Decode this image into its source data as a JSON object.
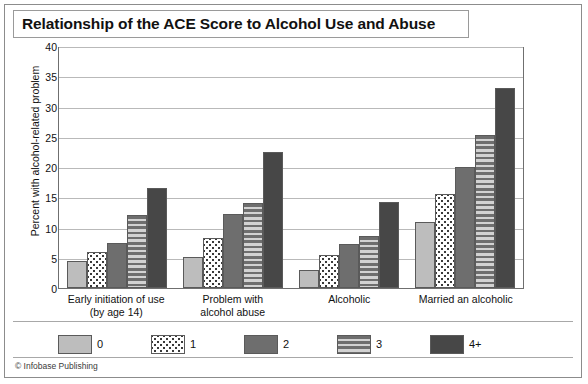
{
  "figure": {
    "title": "Relationship of the ACE Score to Alcohol Use and Abuse",
    "credit": "© Infobase Publishing"
  },
  "chart_data": {
    "type": "bar",
    "title": "Relationship of the ACE Score to Alcohol Use and Abuse",
    "xlabel": "",
    "ylabel": "Percent with alcohol-related problem",
    "ylim": [
      0,
      40
    ],
    "yticks": [
      0,
      5,
      10,
      15,
      20,
      25,
      30,
      35,
      40
    ],
    "grid": true,
    "legend_position": "bottom",
    "categories": [
      "Early initiation of use (by age 14)",
      "Problem with alcohol abuse",
      "Alcoholic",
      "Married an alcoholic"
    ],
    "category_lines": [
      [
        "Early initiation of use",
        "(by age 14)"
      ],
      [
        "Problem with",
        "alcohol abuse"
      ],
      [
        "Alcoholic",
        ""
      ],
      [
        "Married an alcoholic",
        ""
      ]
    ],
    "series": [
      {
        "name": "0",
        "fill": "solid-light-gray",
        "color": "#bdbdbd",
        "values": [
          4.4,
          5.2,
          2.9,
          10.9
        ]
      },
      {
        "name": "1",
        "fill": "white-speckled",
        "color": "#ffffff",
        "values": [
          6.0,
          8.3,
          5.5,
          15.6
        ]
      },
      {
        "name": "2",
        "fill": "solid-medium-gray",
        "color": "#6e6e6e",
        "values": [
          7.5,
          12.3,
          7.3,
          20.0
        ]
      },
      {
        "name": "3",
        "fill": "horizontal-stripes",
        "color": "#6e6e6e",
        "values": [
          12.1,
          14.0,
          8.6,
          25.3
        ]
      },
      {
        "name": "4+",
        "fill": "solid-dark-gray",
        "color": "#474747",
        "values": [
          16.5,
          22.5,
          14.3,
          33.0
        ]
      }
    ]
  }
}
